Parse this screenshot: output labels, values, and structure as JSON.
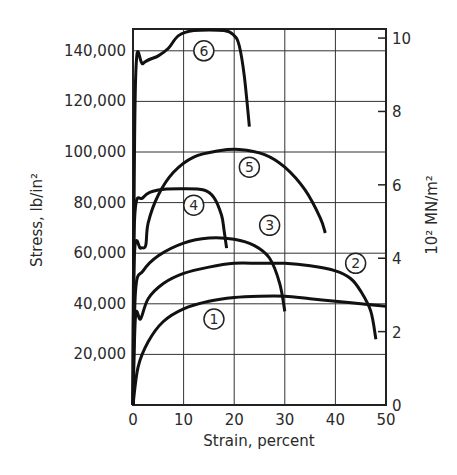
{
  "chart_data": {
    "type": "line",
    "title": "",
    "xlabel": "Strain, percent",
    "ylabel": "Stress, lb/in²",
    "ylabel_right": "10² MN/m²",
    "xlim": [
      0,
      50
    ],
    "ylim": [
      0,
      148000
    ],
    "ylim_right": [
      0,
      10.2
    ],
    "grid": true,
    "legend": "none (curves labeled with circled numbers 1-6)",
    "x_ticks": [
      0,
      10,
      20,
      30,
      40,
      50
    ],
    "x_tick_labels": [
      "0",
      "10",
      "20",
      "30",
      "40",
      "50"
    ],
    "y_ticks": [
      20000,
      40000,
      60000,
      80000,
      100000,
      120000,
      140000
    ],
    "y_tick_labels": [
      "20,000",
      "40,000",
      "60,000",
      "80,000",
      "100,000",
      "120,000",
      "140,000"
    ],
    "y_right_ticks": [
      0,
      2,
      4,
      6,
      8,
      10
    ],
    "y_right_tick_labels": [
      "0",
      "2",
      "4",
      "6",
      "8",
      "10"
    ],
    "series": [
      {
        "name": "1",
        "x": [
          0,
          1,
          3,
          6,
          10,
          15,
          20,
          25,
          30,
          35,
          40,
          45,
          50
        ],
        "values": [
          0,
          15000,
          25000,
          33000,
          38000,
          41000,
          42500,
          43000,
          43000,
          42000,
          41000,
          40000,
          39000
        ],
        "label_at": [
          16,
          34000
        ]
      },
      {
        "name": "2",
        "x": [
          0,
          0.5,
          1.5,
          3,
          6,
          10,
          15,
          20,
          25,
          30,
          35,
          40,
          43,
          45,
          47,
          48
        ],
        "values": [
          0,
          35000,
          34000,
          42000,
          48000,
          52000,
          54500,
          56000,
          56000,
          56000,
          55000,
          53000,
          50000,
          45000,
          37000,
          26000
        ],
        "label_at": [
          44,
          56000
        ]
      },
      {
        "name": "3",
        "x": [
          0,
          0.5,
          2,
          5,
          10,
          15,
          20,
          24,
          27,
          29,
          30
        ],
        "values": [
          0,
          45000,
          53000,
          59000,
          64000,
          66000,
          65500,
          63000,
          58000,
          48000,
          37000
        ],
        "label_at": [
          27,
          71000
        ]
      },
      {
        "name": "4",
        "x": [
          0,
          0.3,
          2,
          5,
          10,
          14,
          16,
          17.5,
          18,
          18.5
        ],
        "values": [
          0,
          73000,
          82000,
          85000,
          85500,
          85000,
          82000,
          75000,
          69000,
          62000
        ],
        "label_at": [
          12,
          79000
        ]
      },
      {
        "name": "5",
        "x": [
          0,
          0.3,
          1.5,
          2.5,
          3,
          5,
          8,
          12,
          17,
          21,
          26,
          30,
          34,
          37,
          38
        ],
        "values": [
          0,
          60000,
          62000,
          63000,
          72000,
          83000,
          92000,
          98000,
          100500,
          101000,
          99000,
          94000,
          85000,
          74000,
          68000
        ],
        "label_at": [
          23,
          94000
        ]
      },
      {
        "name": "6",
        "x": [
          0,
          0.5,
          2,
          5,
          7,
          9,
          12,
          18,
          20,
          21,
          22,
          23
        ],
        "values": [
          0,
          128000,
          135000,
          138000,
          141000,
          146000,
          148000,
          148000,
          146000,
          142000,
          130000,
          110000
        ],
        "label_at": [
          14,
          140000
        ]
      }
    ]
  }
}
